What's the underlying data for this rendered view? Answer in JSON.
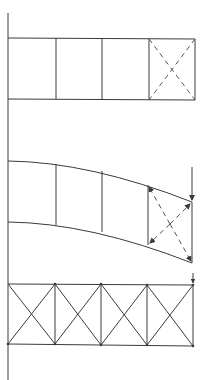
{
  "caption": "",
  "colors": {
    "line": "#3a3a3a",
    "dashed": "#555555",
    "background": "#ffffff"
  },
  "wall": {
    "x": 8,
    "y1": 13,
    "y2": 380
  },
  "figures": [
    {
      "id": "beam-undeformed",
      "description": "Rectangular beam with four panels; last panel has dashed diagonals",
      "panels": 4,
      "top_y": 38,
      "bottom_y": 99,
      "verticals_x": [
        8,
        56,
        102,
        149,
        195
      ],
      "dashed_diagonals_panel": 4
    },
    {
      "id": "beam-deformed",
      "description": "Cantilever beam bent downward under end load; last panel diagonals with arrowheads showing shear deformation",
      "panels": 4,
      "load_arrow": {
        "x": 192,
        "y1": 167,
        "y2": 201
      },
      "nodes_top": [
        [
          8,
          161
        ],
        [
          56,
          164
        ],
        [
          102,
          171
        ],
        [
          148,
          185
        ],
        [
          192,
          202
        ]
      ],
      "nodes_bottom": [
        [
          8,
          222
        ],
        [
          56,
          225
        ],
        [
          102,
          232
        ],
        [
          148,
          245
        ],
        [
          192,
          263
        ]
      ]
    },
    {
      "id": "truss",
      "description": "Cross-braced truss with four X-braced panels and small end load arrow",
      "panels": 4,
      "top_y": 284,
      "bottom_y": 345,
      "verticals_x": [
        8,
        55,
        101,
        147,
        193
      ],
      "load_arrow": {
        "x": 193,
        "y1": 273,
        "y2": 283
      }
    }
  ]
}
